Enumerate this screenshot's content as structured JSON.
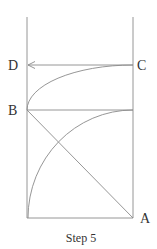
{
  "diagram": {
    "caption": "Step 5",
    "labels": {
      "A": "A",
      "B": "B",
      "C": "C",
      "D": "D"
    },
    "points": {
      "A": [
        133,
        218
      ],
      "B": [
        27,
        110
      ],
      "C": [
        133,
        65
      ],
      "D": [
        27,
        65
      ]
    },
    "stroke_color": "#8a8a8a"
  }
}
